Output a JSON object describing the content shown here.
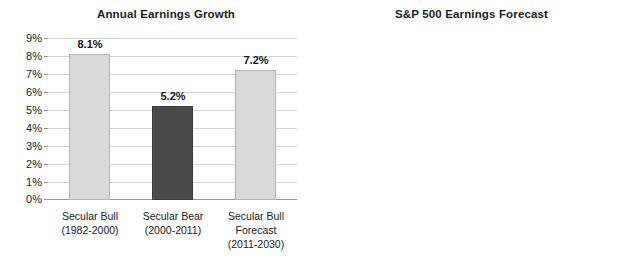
{
  "chart_data": [
    {
      "type": "bar",
      "title": "Annual Earnings Growth",
      "xlabel": "",
      "ylabel": "",
      "ylim": [
        0,
        9
      ],
      "ytick_labels": [
        "9%",
        "8%",
        "7%",
        "6%",
        "5%",
        "4%",
        "3%",
        "2%",
        "1%",
        "0%"
      ],
      "ytick_values": [
        9,
        8,
        7,
        6,
        5,
        4,
        3,
        2,
        1,
        0
      ],
      "grid": true,
      "legend": "none",
      "categories": [
        "Secular Bull",
        "Secular Bear",
        "Secular Bull Forecast"
      ],
      "category_sublabels": [
        "(1982-2000)",
        "(2000-2011)",
        "(2011-2030)"
      ],
      "category_sublabels2": [
        "",
        "",
        ""
      ],
      "category_line3": [
        "",
        "",
        "Forecast"
      ],
      "values": [
        8.1,
        5.2,
        7.2
      ],
      "value_labels": [
        "8.1%",
        "5.2%",
        "7.2%"
      ],
      "bar_colors": [
        "#d9d9d9",
        "#4a4a4a",
        "#d9d9d9"
      ],
      "bars": [
        {
          "label_line1": "Secular Bull",
          "label_line2": "(1982-2000)",
          "label_line3": "",
          "value": 8.1,
          "value_label": "8.1%",
          "color": "#d9d9d9",
          "dark": false
        },
        {
          "label_line1": "Secular Bear",
          "label_line2": "(2000-2011)",
          "label_line3": "",
          "value": 5.2,
          "value_label": "5.2%",
          "color": "#4a4a4a",
          "dark": true
        },
        {
          "label_line1": "Secular Bull",
          "label_line2": "Forecast",
          "label_line3": "(2011-2030)",
          "value": 7.2,
          "value_label": "7.2%",
          "color": "#d9d9d9",
          "dark": false
        }
      ]
    },
    {
      "type": "bar",
      "title": "S&P 500 Earnings Forecast",
      "xlabel": "",
      "ylabel": "",
      "ylim": [
        0,
        400
      ],
      "ytick_labels": [
        "$400",
        "$350",
        "$300",
        "$250",
        "$200",
        "$150",
        "$100",
        "$50",
        "$0"
      ],
      "ytick_values": [
        400,
        350,
        300,
        250,
        200,
        150,
        100,
        50,
        0
      ],
      "grid": true,
      "legend": "none",
      "categories": [
        "2011",
        "2030"
      ],
      "category_sublabels": [
        "(Actual)",
        "(with 7.2% growth)"
      ],
      "values": [
        97,
        363
      ],
      "value_labels": [
        "$97",
        "$363"
      ],
      "bar_colors": [
        "#d9d9d9",
        "#d9d9d9"
      ],
      "bars": [
        {
          "label_line1": "2011",
          "label_line2": "(Actual)",
          "label_line3": "",
          "value": 97,
          "value_label": "$97",
          "color": "#d9d9d9",
          "dark": false
        },
        {
          "label_line1": "2030",
          "label_line2": "(with 7.2% growth)",
          "label_line3": "",
          "value": 363,
          "value_label": "$363",
          "color": "#d9d9d9",
          "dark": false
        }
      ]
    }
  ],
  "colors": {
    "bar_light": "#d9d9d9",
    "bar_dark": "#4a4a4a",
    "gridline": "#d4d4d4",
    "axis": "#9a9a9a",
    "text": "#1c1c1c",
    "background": "#ffffff"
  }
}
